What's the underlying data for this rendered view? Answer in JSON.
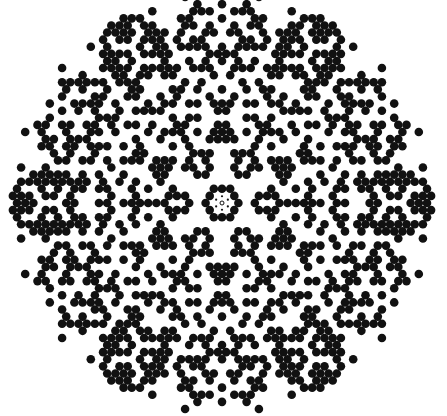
{
  "image": {
    "description": "Circular hexagonal dot pattern with six-fold symmetry (diffraction/quasicrystal-like), black dots on white",
    "width": 447,
    "height": 416,
    "background_color": "#ffffff",
    "dot_color": "#111111"
  },
  "pattern": {
    "center": [
      222,
      203
    ],
    "outer_radius": 212,
    "lattice_spacing": 8.2,
    "dot_radius": 4.3,
    "symmetry": 6,
    "fill_probability": 0.46,
    "seed": 17,
    "center_core": {
      "ring_radius": 9,
      "small_dot_radius": 1.1,
      "small_dot_count": 6,
      "center_mark_radius": 2,
      "dense_ring_inner": 10,
      "dense_ring_outer": 20
    }
  }
}
